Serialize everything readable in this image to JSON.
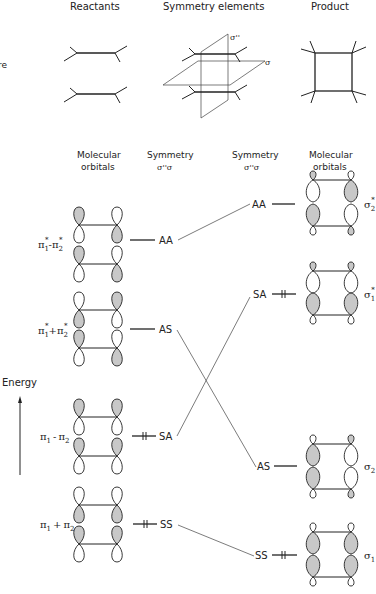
{
  "headers": {
    "reactants": "Reactants",
    "symmetry_elements": "Symmetry elements",
    "product": "Product",
    "edge_fragment": "re"
  },
  "planes": {
    "vertical": "σ''",
    "horizontal": "σ"
  },
  "columns": {
    "left_mo": [
      "Molecular",
      "orbitals"
    ],
    "left_sym": [
      "Symmetry",
      "σ''σ"
    ],
    "right_sym": [
      "Symmetry",
      "σ''σ"
    ],
    "right_mo": [
      "Molecular",
      "orbitals"
    ]
  },
  "axis": {
    "label": "Energy"
  },
  "reactant_levels": [
    {
      "name": "π1* − π2*",
      "main": "π",
      "sub1": "1",
      "sup1": "*",
      "op": "-",
      "main2": "π",
      "sub2": "2",
      "sup2": "*",
      "symmetry": "AA",
      "occupied": false
    },
    {
      "name": "π1* + π2*",
      "main": "π",
      "sub1": "1",
      "sup1": "*",
      "op": "+",
      "main2": "π",
      "sub2": "2",
      "sup2": "*",
      "symmetry": "AS",
      "occupied": false
    },
    {
      "name": "π1 − π2",
      "main": "π",
      "sub1": "1",
      "sup1": "",
      "op": "-",
      "main2": "π",
      "sub2": "2",
      "sup2": "",
      "symmetry": "SA",
      "occupied": true
    },
    {
      "name": "π1 + π2",
      "main": "π",
      "sub1": "1",
      "sup1": "",
      "op": "+",
      "main2": "π",
      "sub2": "2",
      "sup2": "",
      "symmetry": "SS",
      "occupied": true
    }
  ],
  "product_levels": [
    {
      "name": "σ2*",
      "main": "σ",
      "sub": "2",
      "sup": "*",
      "symmetry": "AA",
      "occupied": false
    },
    {
      "name": "σ1*",
      "main": "σ",
      "sub": "1",
      "sup": "*",
      "symmetry": "SA",
      "occupied": true
    },
    {
      "name": "σ2",
      "main": "σ",
      "sub": "2",
      "sup": "",
      "symmetry": "AS",
      "occupied": false
    },
    {
      "name": "σ1",
      "main": "σ",
      "sub": "1",
      "sup": "",
      "symmetry": "SS",
      "occupied": true
    }
  ],
  "correlations": [
    {
      "from": "AA",
      "to": "AA"
    },
    {
      "from": "AS",
      "to": "AS"
    },
    {
      "from": "SA",
      "to": "SA"
    },
    {
      "from": "SS",
      "to": "SS"
    }
  ],
  "colors": {
    "line": "#222222",
    "shaded_lobe": "#c8c8c8",
    "background": "#ffffff"
  }
}
